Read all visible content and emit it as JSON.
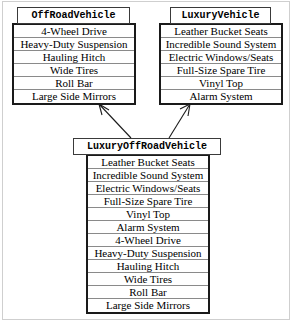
{
  "diagram": {
    "type": "uml-class-inheritance",
    "background_color": "#ffffff",
    "frame_color": "#cfcfcf",
    "line_color": "#1a1a1a",
    "classes": [
      {
        "id": "off-road-vehicle",
        "name": "OffRoadVehicle",
        "role": "parent",
        "attributes": [
          "4-Wheel Drive",
          "Heavy-Duty Suspension",
          "Hauling Hitch",
          "Wide Tires",
          "Roll Bar",
          "Large Side Mirrors"
        ]
      },
      {
        "id": "luxury-vehicle",
        "name": "LuxuryVehicle",
        "role": "parent",
        "attributes": [
          "Leather Bucket Seats",
          "Incredible Sound System",
          "Electric Windows/Seats",
          "Full-Size Spare Tire",
          "Vinyl Top",
          "Alarm System"
        ]
      },
      {
        "id": "luxury-off-road-vehicle",
        "name": "LuxuryOffRoadVehicle",
        "role": "child",
        "attributes": [
          "Leather Bucket Seats",
          "Incredible Sound System",
          "Electric Windows/Seats",
          "Full-Size Spare Tire",
          "Vinyl Top",
          "Alarm System",
          "4-Wheel Drive",
          "Heavy-Duty Suspension",
          "Hauling Hitch",
          "Wide Tires",
          "Roll Bar",
          "Large Side Mirrors"
        ]
      }
    ],
    "relationships": [
      {
        "id": "inherits-off-road",
        "from": "luxury-off-road-vehicle",
        "to": "off-road-vehicle",
        "kind": "inheritance"
      },
      {
        "id": "inherits-luxury",
        "from": "luxury-off-road-vehicle",
        "to": "luxury-vehicle",
        "kind": "inheritance"
      }
    ]
  }
}
